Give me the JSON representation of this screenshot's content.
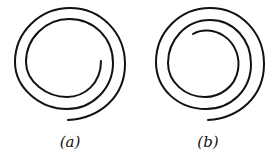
{
  "figure": {
    "panels": [
      {
        "id": "a",
        "label": "(a)",
        "description": "spiral with two turns"
      },
      {
        "id": "b",
        "label": "(b)",
        "description": "spiral with two and a half turns"
      }
    ],
    "stroke_color": "#111111",
    "background": "#ffffff"
  }
}
